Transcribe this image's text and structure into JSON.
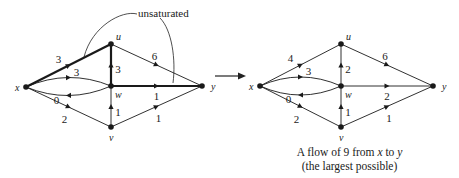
{
  "annotation": {
    "label": "unsaturated"
  },
  "transition_arrow": {
    "direction": "right"
  },
  "caption": {
    "line1_prefix": "A flow of 9 from ",
    "line1_source": "x",
    "line1_middle": " to ",
    "line1_sink": "y",
    "line2": "(the largest possible)"
  },
  "graphs": [
    {
      "id": "before",
      "nodes": [
        {
          "id": "x",
          "label": "x",
          "pos": [
            26,
            87
          ]
        },
        {
          "id": "u",
          "label": "u",
          "pos": [
            111,
            44
          ]
        },
        {
          "id": "w",
          "label": "w",
          "pos": [
            111,
            86
          ]
        },
        {
          "id": "v",
          "label": "v",
          "pos": [
            111,
            127
          ]
        },
        {
          "id": "y",
          "label": "y",
          "pos": [
            202,
            86
          ]
        }
      ],
      "edges": [
        {
          "from": "x",
          "to": "u",
          "label": "3",
          "bold": true
        },
        {
          "from": "x",
          "to": "w",
          "label": "3",
          "bold": false,
          "curve": "upper"
        },
        {
          "from": "w",
          "to": "x",
          "label": "0",
          "bold": false,
          "curve": "lower"
        },
        {
          "from": "x",
          "to": "v",
          "label": "2",
          "bold": false
        },
        {
          "from": "w",
          "to": "u",
          "label": "3",
          "bold": true
        },
        {
          "from": "v",
          "to": "w",
          "label": "1",
          "bold": false
        },
        {
          "from": "u",
          "to": "y",
          "label": "6",
          "bold": false
        },
        {
          "from": "w",
          "to": "y",
          "label": "1",
          "bold": true
        },
        {
          "from": "v",
          "to": "y",
          "label": "1",
          "bold": false
        }
      ]
    },
    {
      "id": "after",
      "total_flow": 9,
      "nodes": [
        {
          "id": "x",
          "label": "x",
          "pos": [
            260,
            86
          ]
        },
        {
          "id": "u",
          "label": "u",
          "pos": [
            341,
            44
          ]
        },
        {
          "id": "w",
          "label": "w",
          "pos": [
            341,
            86
          ]
        },
        {
          "id": "v",
          "label": "v",
          "pos": [
            341,
            127
          ]
        },
        {
          "id": "y",
          "label": "y",
          "pos": [
            433,
            86
          ]
        }
      ],
      "edges": [
        {
          "from": "x",
          "to": "u",
          "label": "4"
        },
        {
          "from": "x",
          "to": "w",
          "label": "3",
          "curve": "upper"
        },
        {
          "from": "w",
          "to": "x",
          "label": "0",
          "curve": "lower"
        },
        {
          "from": "x",
          "to": "v",
          "label": "2"
        },
        {
          "from": "w",
          "to": "u",
          "label": "2"
        },
        {
          "from": "v",
          "to": "w",
          "label": "1"
        },
        {
          "from": "u",
          "to": "y",
          "label": "6"
        },
        {
          "from": "w",
          "to": "y",
          "label": "2"
        },
        {
          "from": "v",
          "to": "y",
          "label": "1"
        }
      ]
    }
  ]
}
